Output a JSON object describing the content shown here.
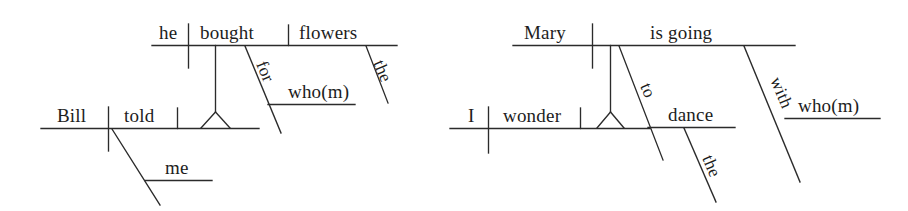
{
  "figure": {
    "kind": "reed-kellogg-sentence-diagram-pair",
    "background_color": "#ffffff",
    "line_color": "#2b2b2b",
    "text_color": "#1d1d1d"
  },
  "diagrams": [
    {
      "id": "left",
      "sentence": "Bill told me who(m) he bought flowers for",
      "main_clause": {
        "subject": "Bill",
        "verb": "told",
        "indirect_object": "me",
        "words": [
          "Bill",
          "told",
          "me"
        ]
      },
      "embedded_clause": {
        "subject": "he",
        "verb": "bought",
        "object": "flowers",
        "determiner": "the",
        "preposition": "for",
        "prep_object": "who(m)",
        "words": [
          "he",
          "bought",
          "flowers",
          "for",
          "who(m)",
          "the"
        ]
      },
      "labels": {
        "top_subject": "he",
        "top_verb": "bought",
        "top_object": "flowers",
        "prep": "for",
        "prep_object": "who(m)",
        "determiner": "the",
        "bottom_subject": "Bill",
        "bottom_verb": "told",
        "bottom_object": "me"
      }
    },
    {
      "id": "right",
      "sentence": "I wonder who(m) Mary is going to dance the with",
      "main_clause": {
        "subject": "I",
        "verb": "wonder",
        "words": [
          "I",
          "wonder"
        ]
      },
      "embedded_clause": {
        "subject": "Mary",
        "verb": "is going",
        "infinitive_marker": "to",
        "infinitive_verb": "dance",
        "determiner": "the",
        "preposition": "with",
        "prep_object": "who(m)",
        "words": [
          "Mary",
          "is going",
          "to",
          "dance",
          "the",
          "with",
          "who(m)"
        ]
      },
      "labels": {
        "top_subject": "Mary",
        "top_verb": "is going",
        "infinitive_marker": "to",
        "infinitive_verb": "dance",
        "determiner": "the",
        "prep": "with",
        "prep_object": "who(m)",
        "bottom_subject": "I",
        "bottom_verb": "wonder"
      }
    }
  ]
}
